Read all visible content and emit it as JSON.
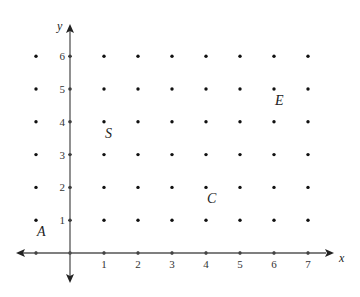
{
  "diagram": {
    "type": "coordinate-grid",
    "x_axis": {
      "label": "x",
      "ticks": [
        "1",
        "2",
        "3",
        "4",
        "5",
        "6",
        "7"
      ]
    },
    "y_axis": {
      "label": "y",
      "ticks": [
        "1",
        "2",
        "3",
        "4",
        "5",
        "6"
      ]
    },
    "grid_dots": {
      "x_range": [
        -1,
        7
      ],
      "y_range": [
        0,
        6
      ]
    },
    "points": [
      {
        "label": "A",
        "x": -1,
        "y": 1
      },
      {
        "label": "S",
        "x": 1,
        "y": 4
      },
      {
        "label": "C",
        "x": 4,
        "y": 2
      },
      {
        "label": "E",
        "x": 6,
        "y": 5
      }
    ],
    "colors": {
      "axis": "#555555",
      "dot": "#111111",
      "text": "#222222"
    }
  }
}
